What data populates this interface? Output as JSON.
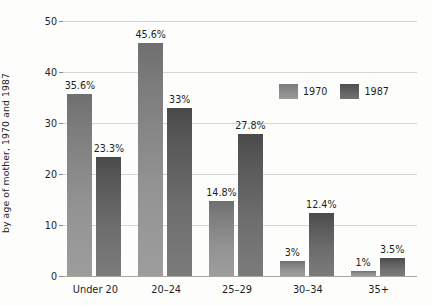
{
  "chart_data": {
    "type": "bar",
    "title": "",
    "xlabel": "",
    "ylabel": "Percentage of first births\nby age of mother, 1970 and 1987",
    "ylabel_line1": "Percentage of first births",
    "ylabel_line2": "by age of mother, 1970 and 1987",
    "categories": [
      "Under 20",
      "20–24",
      "25–29",
      "30–34",
      "35+"
    ],
    "ylim": [
      0,
      50
    ],
    "yticks": [
      0,
      10,
      20,
      30,
      40,
      50
    ],
    "ytick_labels": [
      "0",
      "10",
      "20",
      "30",
      "40",
      "50"
    ],
    "grid": true,
    "legend_position": "upper right",
    "series": [
      {
        "name": "1970",
        "color": "#8e8e8e",
        "values": [
          35.6,
          45.6,
          14.8,
          3,
          1
        ],
        "data_labels": [
          "35.6%",
          "45.6%",
          "14.8%",
          "3%",
          "1%"
        ]
      },
      {
        "name": "1987",
        "color": "#636363",
        "values": [
          23.3,
          33,
          27.8,
          12.4,
          3.5
        ],
        "data_labels": [
          "23.3%",
          "33%",
          "27.8%",
          "12.4%",
          "3.5%"
        ]
      }
    ]
  }
}
